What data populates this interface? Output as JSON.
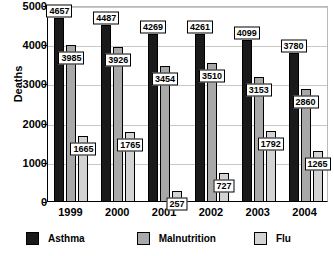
{
  "chart_data": {
    "type": "bar",
    "title": "",
    "xlabel": "",
    "ylabel": "Deaths",
    "ylim": [
      0,
      5000
    ],
    "ytick_step": 1000,
    "yticks": [
      "0",
      "1000",
      "2000",
      "3000",
      "4000",
      "5000"
    ],
    "grid": true,
    "legend_position": "bottom",
    "categories": [
      "1999",
      "2000",
      "2001",
      "2002",
      "2003",
      "2004"
    ],
    "series": [
      {
        "name": "Asthma",
        "color": "#1a1a1a",
        "values": [
          4657,
          4487,
          4269,
          4261,
          4099,
          3780
        ],
        "labels": [
          "4657",
          "4487",
          "4269",
          "4261",
          "4099",
          "3780"
        ]
      },
      {
        "name": "Malnutrition",
        "color": "#a8a8a8",
        "values": [
          3985,
          3926,
          3454,
          3510,
          3153,
          2860
        ],
        "labels": [
          "3985",
          "3926",
          "3454",
          "3510",
          "3153",
          "2860"
        ]
      },
      {
        "name": "Flu",
        "color": "#d3d3d3",
        "values": [
          1665,
          1765,
          257,
          727,
          1792,
          1265
        ],
        "labels": [
          "1665",
          "1765",
          "257",
          "727",
          "1792",
          "1265"
        ]
      }
    ]
  },
  "axis": {
    "y_title": "Deaths"
  },
  "legend": {
    "items": [
      {
        "label": "Asthma",
        "color": "#1a1a1a"
      },
      {
        "label": "Malnutrition",
        "color": "#a8a8a8"
      },
      {
        "label": "Flu",
        "color": "#d3d3d3"
      }
    ]
  }
}
